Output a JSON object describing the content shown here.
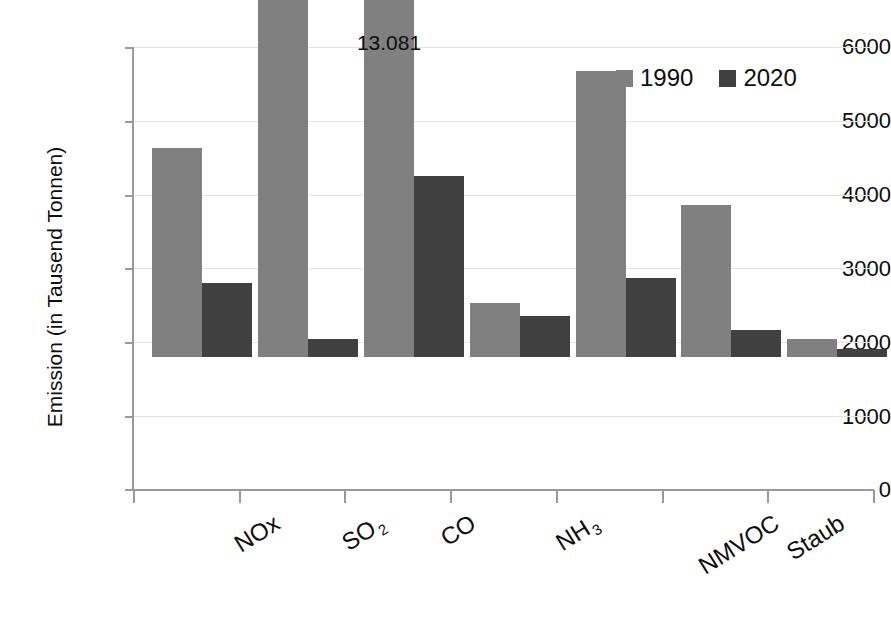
{
  "chart_data": {
    "type": "bar",
    "title": "",
    "subtitle": "",
    "xlabel": "",
    "ylabel": "Emission (in Tausend Tonnen)",
    "categories": [
      "NOx",
      "SO2",
      "CO",
      "NH3",
      "NMVOC",
      "Staub",
      "Feinstaub"
    ],
    "category_labels_html": [
      "NOx",
      "SO<sub>2</sub>",
      "CO",
      "NH<sub>3</sub>",
      "NMVOC",
      "Staub",
      "Feinstaub"
    ],
    "series": [
      {
        "name": "1990",
        "color": "#808080",
        "values": [
          2840,
          5420,
          13081,
          740,
          3880,
          2070,
          240
        ]
      },
      {
        "name": "2020",
        "color": "#404040",
        "values": [
          1010,
          240,
          2460,
          550,
          1070,
          360,
          110
        ]
      }
    ],
    "ylim": [
      0,
      6000
    ],
    "yticks": [
      0,
      1000,
      2000,
      3000,
      4000,
      5000,
      6000
    ],
    "ytick_labels": [
      "0",
      "1000",
      "2000",
      "3000",
      "4000",
      "5000",
      "6000"
    ],
    "grid": true,
    "legend_position": "top-right",
    "annotations": [
      {
        "name": "co-1990-truncated-value",
        "text": "13.081",
        "category": "CO",
        "series": "1990",
        "note": "bar axis-broken above plot maximum"
      }
    ]
  },
  "legend": {
    "entries": [
      {
        "label": "1990",
        "color": "#808080"
      },
      {
        "label": "2020",
        "color": "#404040"
      }
    ]
  },
  "axis": {
    "y_title": "Emission (in Tausend Tonnen)",
    "y_tick_labels": [
      "6000",
      "5000",
      "4000",
      "3000",
      "2000",
      "1000",
      "0"
    ]
  },
  "colors": {
    "series_1990": "#808080",
    "series_2020": "#404040",
    "gridline": "#e3e3e3",
    "axis": "#9a9a9a",
    "text": "#0d0d0d",
    "background": "#ffffff"
  }
}
